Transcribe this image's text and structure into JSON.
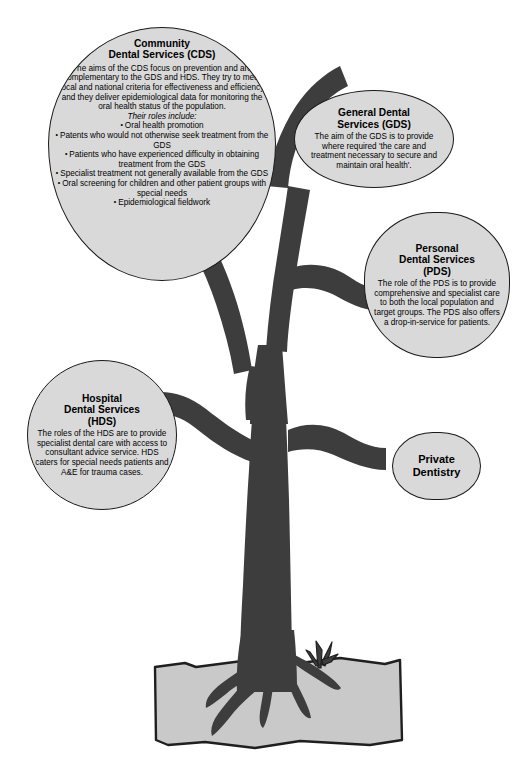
{
  "diagram": {
    "name": "dental-services-tree",
    "background_color": "#ffffff",
    "trunk_color": "#3d3d3d",
    "ground_color": "#c9c9c9",
    "bubble_fill": "#d9d9d9",
    "bubble_stroke": "#1a1a1a"
  },
  "bubbles": {
    "cds": {
      "title_line1": "Community",
      "title_line2": "Dental Services (CDS)",
      "body": "The aims of the CDS focus on prevention and are complementary to the GDS and HDS. They try to meet local and national criteria for effectiveness and efficiency and they deliver epidemiological data for monitoring the oral health status of the population.",
      "roles_heading": "Their roles include:",
      "roles": [
        "Oral health promotion",
        "Patents who would not otherwise seek treatment from the GDS",
        "Patients who have experienced difficulty in obtaining treatment from the GDS",
        "Specialist treatment not generally available from the GDS",
        "Oral screening for children and other patient groups with special needs",
        "Epidemiological fieldwork"
      ]
    },
    "gds": {
      "title_line1": "General Dental",
      "title_line2": "Services (GDS)",
      "body": "The aim of the GDS is to provide where required 'the care and treatment necessary to secure and maintain oral health'."
    },
    "pds": {
      "title_line1": "Personal",
      "title_line2": "Dental Services",
      "title_line3": "(PDS)",
      "body": "The role of the PDS is to provide comprehensive and specialist care to both the local population and target groups. The PDS also offers a drop-in-service for patients."
    },
    "hds": {
      "title_line1": "Hospital",
      "title_line2": "Dental Services",
      "title_line3": "(HDS)",
      "body": "The roles of the HDS are to provide specialist dental care with access to consultant advice service. HDS caters for special needs patients and A&E for trauma cases."
    },
    "private": {
      "title_line1": "Private",
      "title_line2": "Dentistry"
    }
  }
}
